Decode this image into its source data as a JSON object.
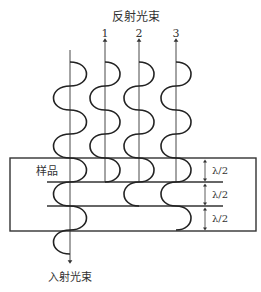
{
  "diagram": {
    "title_reflected": "反射光束",
    "title_incident": "入射光束",
    "sample_label": "样品",
    "beam_labels": [
      "1",
      "2",
      "3"
    ],
    "spacing_labels": [
      "λ/2",
      "λ/2",
      "λ/2"
    ],
    "colors": {
      "line": "#333333",
      "wave": "#222222",
      "background": "#ffffff"
    }
  }
}
